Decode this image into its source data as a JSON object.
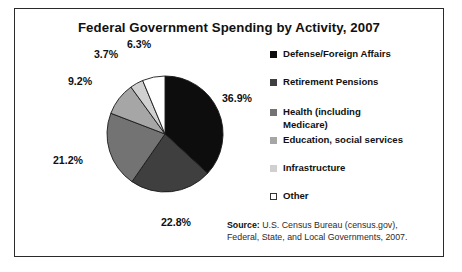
{
  "figure": {
    "title": "Federal Government Spending by Activity, 2007",
    "source_label": "Source:",
    "source_text": " U.S. Census Bureau (census.gov), Federal, State, and Local Governments, 2007."
  },
  "chart_data": {
    "type": "pie",
    "title": "Federal Government Spending by Activity, 2007",
    "xlabel": "",
    "ylabel": "",
    "legend_position": "right",
    "grid": false,
    "start_angle": 0,
    "direction": "clockwise",
    "unit": "%",
    "categories": [
      "Defense/Foreign Affairs",
      "Retirement Pensions",
      "Health (including Medicare)",
      "Education, social services",
      "Infrastructure",
      "Other"
    ],
    "values": [
      36.9,
      22.8,
      21.2,
      9.2,
      3.7,
      6.3
    ],
    "labels": [
      "36.9%",
      "22.8%",
      "21.2%",
      "9.2%",
      "3.7%",
      "6.3%"
    ],
    "colors": [
      "#0d0d0d",
      "#3f3f3f",
      "#737373",
      "#a6a6a6",
      "#d0d0d0",
      "#ffffff"
    ],
    "slice_edge_color": "#1a1a1a",
    "label_positions": [
      {
        "x": 237,
        "y": 98
      },
      {
        "x": 176,
        "y": 222
      },
      {
        "x": 68,
        "y": 160
      },
      {
        "x": 80,
        "y": 81
      },
      {
        "x": 106,
        "y": 54
      },
      {
        "x": 139,
        "y": 44
      }
    ],
    "center": {
      "x": 165,
      "y": 134
    },
    "radius": 58
  },
  "legend": {
    "items": [
      {
        "label": "Defense/Foreign Affairs",
        "color": "#0d0d0d",
        "top": 8,
        "outlined": false
      },
      {
        "label": "Retirement Pensions",
        "color": "#3f3f3f",
        "top": 36,
        "outlined": false
      },
      {
        "label": "Health (including Medicare)",
        "color": "#737373",
        "top": 66,
        "outlined": false
      },
      {
        "label": "Education, social services",
        "color": "#a6a6a6",
        "top": 94,
        "outlined": false
      },
      {
        "label": "Infrastructure",
        "color": "#d0d0d0",
        "top": 122,
        "outlined": false
      },
      {
        "label": "Other",
        "color": "#ffffff",
        "top": 150,
        "outlined": true
      }
    ]
  }
}
